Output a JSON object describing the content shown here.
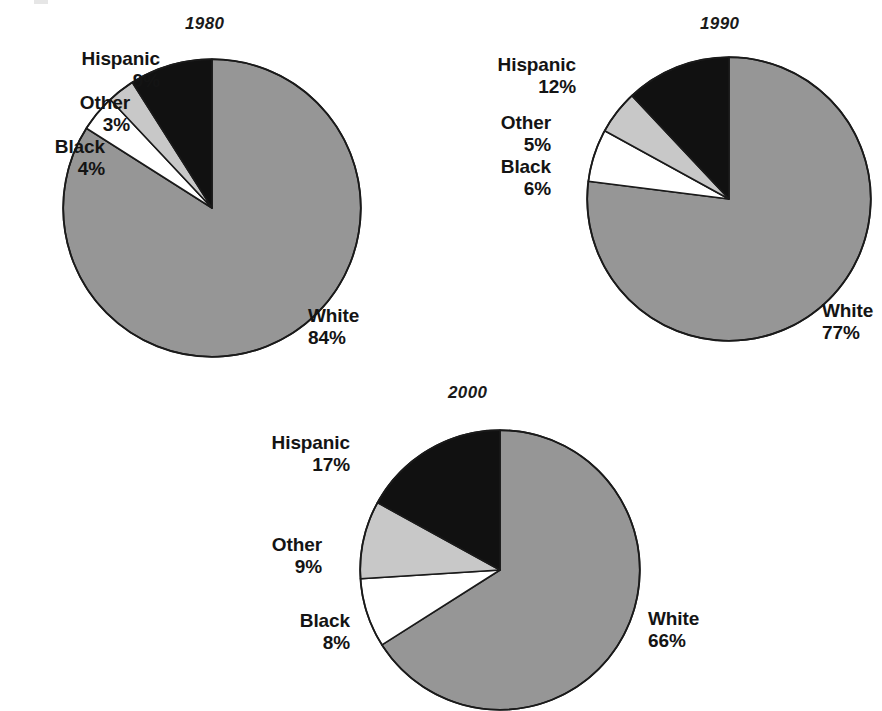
{
  "figure": {
    "background": "#ffffff",
    "width": 882,
    "height": 710
  },
  "palette": {
    "white_slice": "#969696",
    "other_slice": "#c8c8c8",
    "black_slice": "#ffffff",
    "hispanic_slice": "#111111",
    "outline": "#1a1a1a",
    "text": "#141414"
  },
  "charts": [
    {
      "title": "1980",
      "labels": {
        "hispanic_name": "Hispanic",
        "hispanic_value": "9%",
        "other_name": "Other",
        "other_value": "3%",
        "black_name": "Black",
        "black_value": "4%",
        "white_name": "White",
        "white_value": "84%"
      }
    },
    {
      "title": "1990",
      "labels": {
        "hispanic_name": "Hispanic",
        "hispanic_value": "12%",
        "other_name": "Other",
        "other_value": "5%",
        "black_name": "Black",
        "black_value": "6%",
        "white_name": "White",
        "white_value": "77%"
      }
    },
    {
      "title": "2000",
      "labels": {
        "hispanic_name": "Hispanic",
        "hispanic_value": "17%",
        "other_name": "Other",
        "other_value": "9%",
        "black_name": "Black",
        "black_value": "8%",
        "white_name": "White",
        "white_value": "66%"
      }
    }
  ],
  "chart_data": [
    {
      "type": "pie",
      "title": "1980",
      "categories": [
        "White",
        "Hispanic",
        "Other",
        "Black"
      ],
      "values": [
        84,
        9,
        3,
        4
      ],
      "unit": "percent",
      "labels": [
        "White 84%",
        "Hispanic 9%",
        "Other 3%",
        "Black 4%"
      ],
      "colors": [
        "#969696",
        "#111111",
        "#c8c8c8",
        "#ffffff"
      ],
      "start_angle_deg": 0,
      "direction": "counterclockwise-for-minor-slices",
      "legend": "none",
      "grid": false
    },
    {
      "type": "pie",
      "title": "1990",
      "categories": [
        "White",
        "Hispanic",
        "Other",
        "Black"
      ],
      "values": [
        77,
        12,
        5,
        6
      ],
      "unit": "percent",
      "labels": [
        "White 77%",
        "Hispanic 12%",
        "Other 5%",
        "Black 6%"
      ],
      "colors": [
        "#969696",
        "#111111",
        "#c8c8c8",
        "#ffffff"
      ],
      "start_angle_deg": 0,
      "direction": "counterclockwise-for-minor-slices",
      "legend": "none",
      "grid": false
    },
    {
      "type": "pie",
      "title": "2000",
      "categories": [
        "White",
        "Hispanic",
        "Other",
        "Black"
      ],
      "values": [
        66,
        17,
        9,
        8
      ],
      "unit": "percent",
      "labels": [
        "White 66%",
        "Hispanic 17%",
        "Other 9%",
        "Black 8%"
      ],
      "colors": [
        "#969696",
        "#111111",
        "#c8c8c8",
        "#ffffff"
      ],
      "start_angle_deg": 0,
      "direction": "counterclockwise-for-minor-slices",
      "legend": "none",
      "grid": false
    }
  ]
}
